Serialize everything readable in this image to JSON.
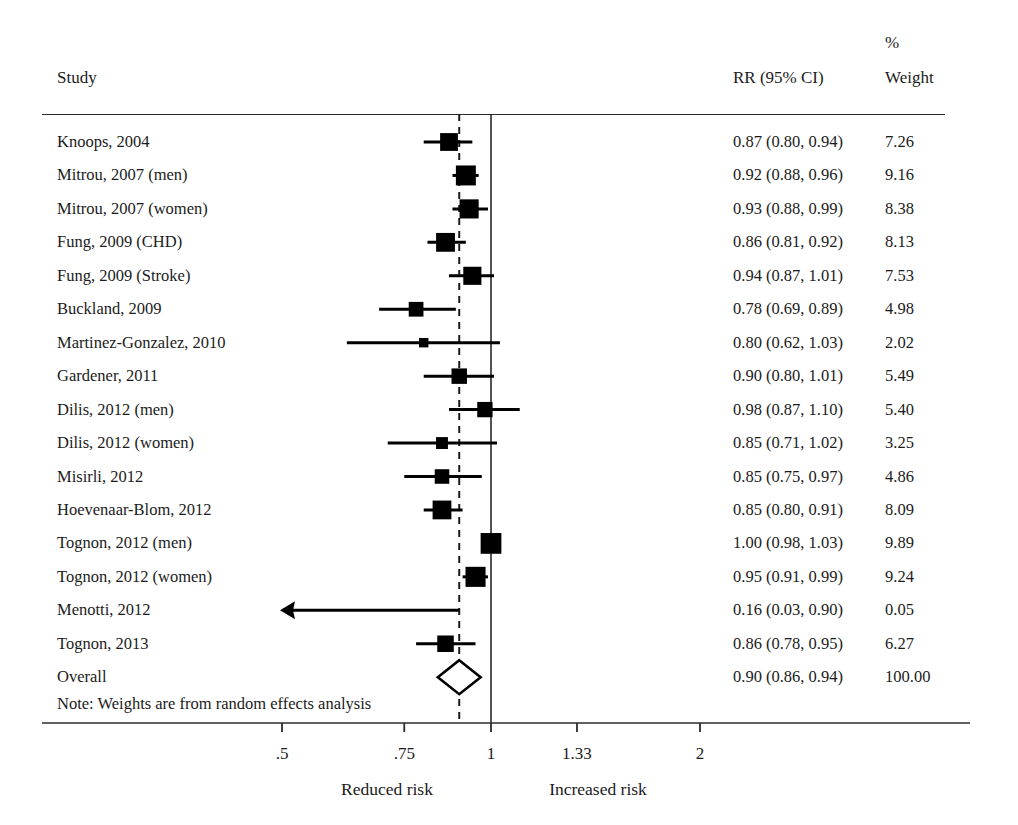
{
  "header": {
    "study_label": "Study",
    "rr_label": "RR (95% CI)",
    "percent_symbol": "%",
    "weight_label": "Weight"
  },
  "note": "Note: Weights are from random effects analysis",
  "axis": {
    "tick_labels": [
      ".5",
      ".75",
      "1",
      "1.33",
      "2"
    ],
    "left_caption": "Reduced risk",
    "right_caption": "Increased risk"
  },
  "colors": {
    "ink": "#1b1b1b",
    "marker": "#000000",
    "rule": "#2b2b2b",
    "diamond_fill": "#ffffff"
  },
  "chart_data": {
    "type": "forest",
    "title": "",
    "xlabel": "",
    "ylabel": "",
    "x_scale": "log",
    "xlim": [
      0.42,
      2.35
    ],
    "ticks": [
      0.5,
      0.75,
      1.0,
      1.33,
      2.0
    ],
    "tick_labels": [
      ".5",
      ".75",
      "1",
      "1.33",
      "2"
    ],
    "null_line": 1.0,
    "overall_line": 0.9,
    "effect_measure": "RR (95% CI)",
    "weight_units": "%",
    "rows": [
      {
        "study": "Knoops, 2004",
        "rr": 0.87,
        "lower": 0.8,
        "upper": 0.94,
        "weight": 7.26,
        "rr_text": "0.87 (0.80, 0.94)",
        "weight_text": "7.26",
        "clipped_left": false
      },
      {
        "study": "Mitrou, 2007 (men)",
        "rr": 0.92,
        "lower": 0.88,
        "upper": 0.96,
        "weight": 9.16,
        "rr_text": "0.92 (0.88, 0.96)",
        "weight_text": "9.16",
        "clipped_left": false
      },
      {
        "study": "Mitrou, 2007 (women)",
        "rr": 0.93,
        "lower": 0.88,
        "upper": 0.99,
        "weight": 8.38,
        "rr_text": "0.93 (0.88, 0.99)",
        "weight_text": "8.38",
        "clipped_left": false
      },
      {
        "study": "Fung, 2009 (CHD)",
        "rr": 0.86,
        "lower": 0.81,
        "upper": 0.92,
        "weight": 8.13,
        "rr_text": "0.86 (0.81, 0.92)",
        "weight_text": "8.13",
        "clipped_left": false
      },
      {
        "study": "Fung, 2009 (Stroke)",
        "rr": 0.94,
        "lower": 0.87,
        "upper": 1.01,
        "weight": 7.53,
        "rr_text": "0.94 (0.87, 1.01)",
        "weight_text": "7.53",
        "clipped_left": false
      },
      {
        "study": "Buckland, 2009",
        "rr": 0.78,
        "lower": 0.69,
        "upper": 0.89,
        "weight": 4.98,
        "rr_text": "0.78 (0.69, 0.89)",
        "weight_text": "4.98",
        "clipped_left": false
      },
      {
        "study": "Martinez-Gonzalez, 2010",
        "rr": 0.8,
        "lower": 0.62,
        "upper": 1.03,
        "weight": 2.02,
        "rr_text": "0.80 (0.62, 1.03)",
        "weight_text": "2.02",
        "clipped_left": false
      },
      {
        "study": "Gardener, 2011",
        "rr": 0.9,
        "lower": 0.8,
        "upper": 1.01,
        "weight": 5.49,
        "rr_text": "0.90 (0.80, 1.01)",
        "weight_text": "5.49",
        "clipped_left": false
      },
      {
        "study": "Dilis, 2012 (men)",
        "rr": 0.98,
        "lower": 0.87,
        "upper": 1.1,
        "weight": 5.4,
        "rr_text": "0.98 (0.87, 1.10)",
        "weight_text": "5.40",
        "clipped_left": false
      },
      {
        "study": "Dilis, 2012 (women)",
        "rr": 0.85,
        "lower": 0.71,
        "upper": 1.02,
        "weight": 3.25,
        "rr_text": "0.85 (0.71, 1.02)",
        "weight_text": "3.25",
        "clipped_left": false
      },
      {
        "study": "Misirli, 2012",
        "rr": 0.85,
        "lower": 0.75,
        "upper": 0.97,
        "weight": 4.86,
        "rr_text": "0.85 (0.75, 0.97)",
        "weight_text": "4.86",
        "clipped_left": false
      },
      {
        "study": "Hoevenaar-Blom, 2012",
        "rr": 0.85,
        "lower": 0.8,
        "upper": 0.91,
        "weight": 8.09,
        "rr_text": "0.85 (0.80, 0.91)",
        "weight_text": "8.09",
        "clipped_left": false
      },
      {
        "study": "Tognon, 2012 (men)",
        "rr": 1.0,
        "lower": 0.98,
        "upper": 1.03,
        "weight": 9.89,
        "rr_text": "1.00 (0.98, 1.03)",
        "weight_text": "9.89",
        "clipped_left": false
      },
      {
        "study": "Tognon, 2012 (women)",
        "rr": 0.95,
        "lower": 0.91,
        "upper": 0.99,
        "weight": 9.24,
        "rr_text": "0.95 (0.91, 0.99)",
        "weight_text": "9.24",
        "clipped_left": false
      },
      {
        "study": "Menotti, 2012",
        "rr": 0.16,
        "lower": 0.03,
        "upper": 0.9,
        "weight": 0.05,
        "rr_text": "0.16 (0.03, 0.90)",
        "weight_text": "0.05",
        "clipped_left": true
      },
      {
        "study": "Tognon, 2013",
        "rr": 0.86,
        "lower": 0.78,
        "upper": 0.95,
        "weight": 6.27,
        "rr_text": "0.86 (0.78, 0.95)",
        "weight_text": "6.27",
        "clipped_left": false
      },
      {
        "study": "Overall",
        "rr": 0.9,
        "lower": 0.86,
        "upper": 0.94,
        "weight": 100.0,
        "rr_text": "0.90 (0.86, 0.94)",
        "weight_text": "100.00",
        "clipped_left": false,
        "is_overall": true
      }
    ]
  }
}
